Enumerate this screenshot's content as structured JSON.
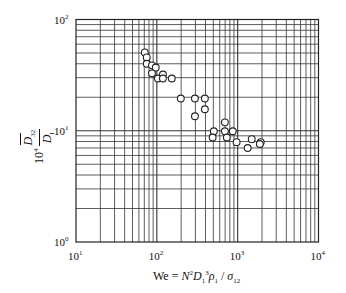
{
  "chart_data": {
    "type": "scatter",
    "title": "",
    "xlabel": "We = N^2 D_1^3 ρ_1 / σ_12",
    "ylabel": "10^4 D̄_32 / D_I",
    "xscale": "log",
    "yscale": "log",
    "xlim": [
      10,
      10000
    ],
    "ylim": [
      1,
      100
    ],
    "grid": true,
    "grid_style": "full log major+minor gridlines",
    "legend": null,
    "marker": "open circle",
    "x_ticks": [
      "10^1",
      "10^2",
      "10^3",
      "10^4"
    ],
    "y_ticks": [
      "10^0",
      "10^1",
      "10^2"
    ],
    "series": [
      {
        "name": "data",
        "points": [
          [
            71,
            50.6
          ],
          [
            75,
            45.6
          ],
          [
            75,
            40
          ],
          [
            87,
            38.7
          ],
          [
            97,
            37
          ],
          [
            87,
            32.8
          ],
          [
            103,
            29.5
          ],
          [
            119,
            32
          ],
          [
            119,
            29.5
          ],
          [
            153,
            29.5
          ],
          [
            198,
            19.5
          ],
          [
            296,
            19.5
          ],
          [
            393,
            19.5
          ],
          [
            296,
            13.5
          ],
          [
            393,
            15.6
          ],
          [
            695,
            11.9
          ],
          [
            507,
            9.9
          ],
          [
            695,
            9.9
          ],
          [
            870,
            9.9
          ],
          [
            490,
            8.7
          ],
          [
            735,
            8.7
          ],
          [
            970,
            7.9
          ],
          [
            1493,
            8.4
          ],
          [
            1930,
            7.9
          ],
          [
            1880,
            7.6
          ],
          [
            1330,
            7.0
          ]
        ]
      }
    ]
  },
  "axes": {
    "x_ticks": [
      {
        "base": "10",
        "exp": "1"
      },
      {
        "base": "10",
        "exp": "2"
      },
      {
        "base": "10",
        "exp": "3"
      },
      {
        "base": "10",
        "exp": "4"
      }
    ],
    "y_ticks": [
      {
        "base": "10",
        "exp": "0"
      },
      {
        "base": "10",
        "exp": "1"
      },
      {
        "base": "10",
        "exp": "2"
      }
    ],
    "ylabel": {
      "prefix": "10",
      "prefix_exp": "4",
      "num": "D",
      "num_sub": "32",
      "den": "D",
      "den_sub": "I"
    },
    "xlabel": {
      "lhs": "We = ",
      "n": "N",
      "n_exp": "2",
      "d": "D",
      "d_sub": "1",
      "d_exp": "3",
      "rho": "ρ",
      "rho_sub": "1",
      "slash": " / ",
      "sigma": "σ",
      "sigma_sub": "12"
    }
  }
}
